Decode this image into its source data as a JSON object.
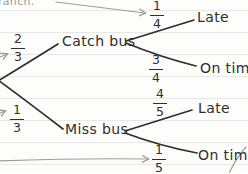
{
  "colors": {
    "ink": "#2e2e2e",
    "annotation_gray": "#9c9c9c",
    "ruled_line": "#e9e9e3",
    "background": "#fdfdfb"
  },
  "note": {
    "clipped_word": "ranch."
  },
  "tree": {
    "type": "probability-tree",
    "root_branches": [
      {
        "label": "Catch bus",
        "probability": {
          "num": "2",
          "den": "3"
        }
      },
      {
        "label": "Miss bus",
        "probability": {
          "num": "1",
          "den": "3"
        }
      }
    ],
    "outcomes": [
      {
        "parent": "Catch bus",
        "label": "Late",
        "probability": {
          "num": "1",
          "den": "4"
        }
      },
      {
        "parent": "Catch bus",
        "label": "On time",
        "probability": {
          "num": "3",
          "den": "4"
        }
      },
      {
        "parent": "Miss bus",
        "label": "Late",
        "probability": {
          "num": "4",
          "den": "5"
        }
      },
      {
        "parent": "Miss bus",
        "label": "On time",
        "probability": {
          "num": "1",
          "den": "5"
        }
      }
    ]
  }
}
